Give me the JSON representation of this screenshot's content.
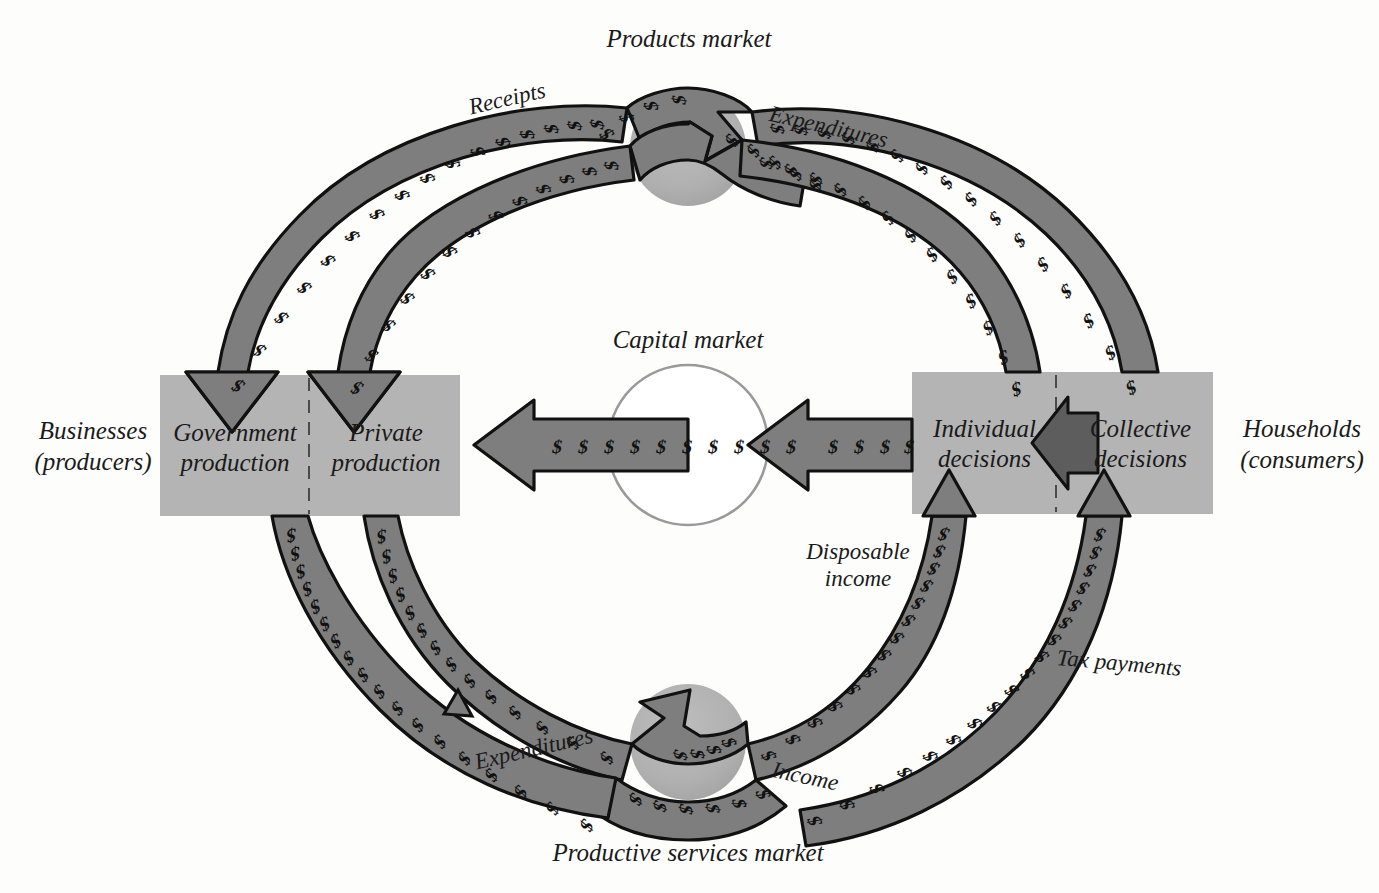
{
  "diagram": {
    "background_color": "#fdfdfc",
    "band_fill": "#7e7e7e",
    "band_stroke": "#111111",
    "box_fill": "#b4b4b4",
    "market_circle_fill": "#b0b0b0",
    "capital_circle_fill": "#ffffff",
    "text_color": "#1a1a1a"
  },
  "markets": {
    "products": {
      "label": "Products market",
      "cx": 688,
      "cy": 148,
      "r": 58
    },
    "productive_services": {
      "label": "Productive services market",
      "cx": 688,
      "cy": 742,
      "r": 58
    },
    "capital": {
      "label": "Capital market",
      "cx": 688,
      "cy": 445,
      "r": 80
    }
  },
  "sectors": {
    "left": {
      "outer_label_line1": "Businesses",
      "outer_label_line2": "(producers)",
      "cells": [
        {
          "line1": "Government",
          "line2": "production"
        },
        {
          "line1": "Private",
          "line2": "production"
        }
      ]
    },
    "right": {
      "outer_label_line1": "Households",
      "outer_label_line2": "(consumers)",
      "cells": [
        {
          "line1": "Individual",
          "line2": "decisions"
        },
        {
          "line1": "Collective",
          "line2": "decisions"
        }
      ]
    }
  },
  "flow_labels": {
    "receipts": "Receipts",
    "expenditures_top": "Expenditures",
    "expenditures_bottom": "Expenditures",
    "income": "Income",
    "disposable_income_line1": "Disposable",
    "disposable_income_line2": "income",
    "tax_payments": "Tax payments"
  },
  "currency_glyph": "$"
}
